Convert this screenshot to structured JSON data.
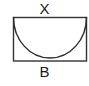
{
  "figure": {
    "kind": "geometry-diagram",
    "canvas": {
      "width": 89,
      "height": 86,
      "background": "#ffffff"
    },
    "stroke": {
      "color": "#333333",
      "width": 1.4
    },
    "labels": {
      "top": "X",
      "bottom": "B"
    },
    "shapes": {
      "rectangle": {
        "name": "bounding-rectangle",
        "x": 13.5,
        "y": 17.5,
        "width": 73,
        "height": 43.5
      },
      "arc": {
        "name": "inscribed-semi-ellipse",
        "start_x": 13.5,
        "start_y": 17.5,
        "end_x": 86.5,
        "end_y": 17.5,
        "radius_x": 36.5,
        "radius_y": 40.5,
        "sweep": 1,
        "lowest_y": 58
      }
    }
  },
  "chart_data": {
    "type": "diagram",
    "annotations": [
      {
        "text": "X",
        "position": "above-top-edge",
        "meaning": "width-of-rectangle"
      },
      {
        "text": "B",
        "position": "below-bottom-edge",
        "meaning": "base-of-rectangle"
      }
    ],
    "elements": [
      {
        "type": "rectangle",
        "x": 13.5,
        "y": 17.5,
        "width": 73,
        "height": 43.5
      },
      {
        "type": "semi-ellipse-arc",
        "from": [
          13.5,
          17.5
        ],
        "to": [
          86.5,
          17.5
        ],
        "rx": 36.5,
        "ry": 40.5,
        "opens": "upward"
      }
    ]
  }
}
